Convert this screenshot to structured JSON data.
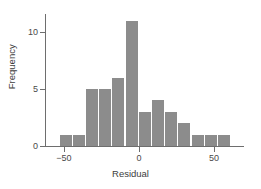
{
  "chart_data": {
    "type": "bar",
    "title": "",
    "subtitle": "",
    "xlabel": "Residual",
    "ylabel": "Frequency",
    "xlim": [
      -62,
      68
    ],
    "ylim": [
      0,
      11.6
    ],
    "grid": false,
    "legend": null,
    "bin_width": 8.8,
    "bar_color": "#8c8c8c",
    "axis_color": "#6e6e6e",
    "background": "#ffffff",
    "x_ticks": [
      -50,
      0,
      50
    ],
    "x_tick_labels": [
      "−50",
      "0",
      "50"
    ],
    "y_ticks": [
      0,
      5,
      10
    ],
    "y_tick_labels": [
      "0",
      "5",
      "10"
    ],
    "bin_starts": [
      -53,
      -44.2,
      -35.4,
      -26.6,
      -17.8,
      -9,
      -0.2,
      8.6,
      17.4,
      26.2,
      35,
      43.8,
      52.6,
      61.4
    ],
    "categories": [
      "-53 to -44",
      "-44 to -35",
      "-35 to -27",
      "-27 to -18",
      "-18 to -9",
      "-9 to 0",
      "0 to 9",
      "9 to 17",
      "17 to 26",
      "26 to 35",
      "35 to 44",
      "44 to 53",
      "53 to 61"
    ],
    "values": [
      1,
      1,
      5,
      5,
      6,
      11,
      3,
      4,
      3,
      2,
      1,
      1,
      1
    ]
  },
  "axes": {
    "x_axis_name": "Residual",
    "y_axis_name": "Frequency"
  }
}
